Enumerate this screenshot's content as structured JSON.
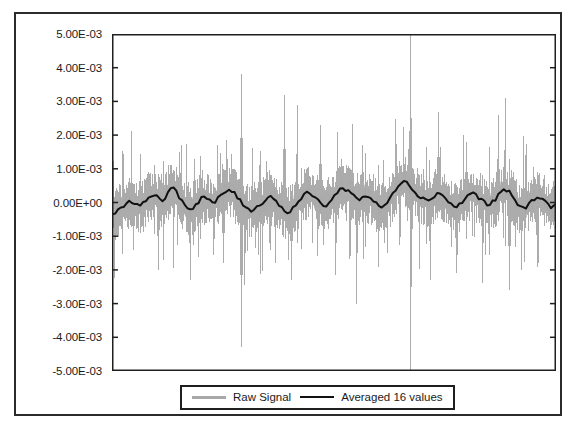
{
  "chart_data": {
    "type": "line",
    "title": "",
    "subtitle": "",
    "xlabel": "",
    "ylabel": "",
    "grid": false,
    "legend_position": "bottom",
    "ylim": [
      -0.005,
      0.005
    ],
    "ytick_values": [
      0.005,
      0.004,
      0.003,
      0.002,
      0.001,
      0,
      -0.001,
      -0.002,
      -0.003,
      -0.004,
      -0.005
    ],
    "ytick_labels": [
      "5.00E-03",
      "4.00E-03",
      "3.00E-03",
      "2.00E-03",
      "1.00E-03",
      "0.00E+00",
      "-1.00E-03",
      "-2.00E-03",
      "-3.00E-03",
      "-4.00E-03",
      "-5.00E-03"
    ],
    "xtick_labels": [],
    "xlim": [
      0,
      640
    ],
    "n_points": 640,
    "series": [
      {
        "name": "Raw Signal",
        "color": "#a8a8a8",
        "style": "noisy-spiky",
        "linewidth": 1,
        "baseline": 0.0,
        "noise_amplitude": 0.0006,
        "notable_positive_spikes": [
          {
            "x": 60,
            "value": 0.0011
          },
          {
            "x": 96,
            "value": 0.0015
          },
          {
            "x": 118,
            "value": 0.0013
          },
          {
            "x": 152,
            "value": 0.0017
          },
          {
            "x": 186,
            "value": 0.0038
          },
          {
            "x": 212,
            "value": 0.0011
          },
          {
            "x": 248,
            "value": 0.0032
          },
          {
            "x": 266,
            "value": 0.0029
          },
          {
            "x": 300,
            "value": 0.0023
          },
          {
            "x": 330,
            "value": 0.0013
          },
          {
            "x": 360,
            "value": 0.0017
          },
          {
            "x": 384,
            "value": 0.0011
          },
          {
            "x": 430,
            "value": 0.005
          },
          {
            "x": 470,
            "value": 0.0027
          },
          {
            "x": 510,
            "value": 0.0018
          },
          {
            "x": 556,
            "value": 0.0026
          },
          {
            "x": 566,
            "value": 0.0031
          },
          {
            "x": 596,
            "value": 0.0014
          }
        ],
        "notable_negative_spikes": [
          {
            "x": 30,
            "value": -0.0014
          },
          {
            "x": 66,
            "value": -0.002
          },
          {
            "x": 112,
            "value": -0.0023
          },
          {
            "x": 160,
            "value": -0.0018
          },
          {
            "x": 186,
            "value": -0.0043
          },
          {
            "x": 228,
            "value": -0.0014
          },
          {
            "x": 258,
            "value": -0.0023
          },
          {
            "x": 296,
            "value": -0.0016
          },
          {
            "x": 352,
            "value": -0.003
          },
          {
            "x": 396,
            "value": -0.0015
          },
          {
            "x": 430,
            "value": -0.005
          },
          {
            "x": 458,
            "value": -0.0023
          },
          {
            "x": 496,
            "value": -0.0021
          },
          {
            "x": 534,
            "value": -0.0024
          },
          {
            "x": 572,
            "value": -0.0026
          },
          {
            "x": 612,
            "value": -0.0019
          }
        ]
      },
      {
        "name": "Averaged 16 values",
        "color": "#111111",
        "style": "smooth",
        "linewidth": 2,
        "baseline": 0.0,
        "values_sampled": [
          -0.00035,
          -0.0002,
          -0.0001,
          5e-05,
          0.0,
          -0.00015,
          0.0001,
          0.00025,
          0.00015,
          5e-05,
          0.00035,
          0.0004,
          0.00015,
          -0.0001,
          -0.0002,
          -5e-05,
          0.0002,
          0.0001,
          -5e-05,
          0.00015,
          0.0003,
          0.0004,
          0.0002,
          0.0,
          -0.00015,
          -0.00025,
          -0.0001,
          5e-05,
          0.0002,
          0.0001,
          -0.00015,
          -0.0003,
          -0.0002,
          0.0,
          0.0002,
          0.0003,
          0.00015,
          0.0,
          -0.0001,
          5e-05,
          0.0003,
          0.00045,
          0.00035,
          0.0002,
          0.0001,
          0.0002,
          0.00015,
          -5e-05,
          -0.00015,
          0.0,
          0.00025,
          0.00055,
          0.0007,
          0.0005,
          0.0003,
          0.00015,
          5e-05,
          0.00015,
          0.0003,
          0.0002,
          0.0,
          -0.00015,
          -5e-05,
          0.00015,
          0.0003,
          0.0002,
          5e-05,
          -0.0001,
          5e-05,
          0.00025,
          0.0004,
          0.00025,
          0.0,
          -0.0002,
          -0.0001,
          0.0001,
          0.0002,
          5e-05,
          -0.00015,
          -5e-05
        ]
      }
    ]
  },
  "legend": {
    "entries": [
      {
        "label": "Raw Signal",
        "swatch": "gray-line-sample"
      },
      {
        "label": "Averaged 16 values",
        "swatch": "black-line-sample"
      }
    ]
  },
  "colors": {
    "raw_signal": "#a8a8a8",
    "averaged": "#111111",
    "axis": "#1f1f1f",
    "frame": "#2b2b2b",
    "background": "#ffffff"
  }
}
